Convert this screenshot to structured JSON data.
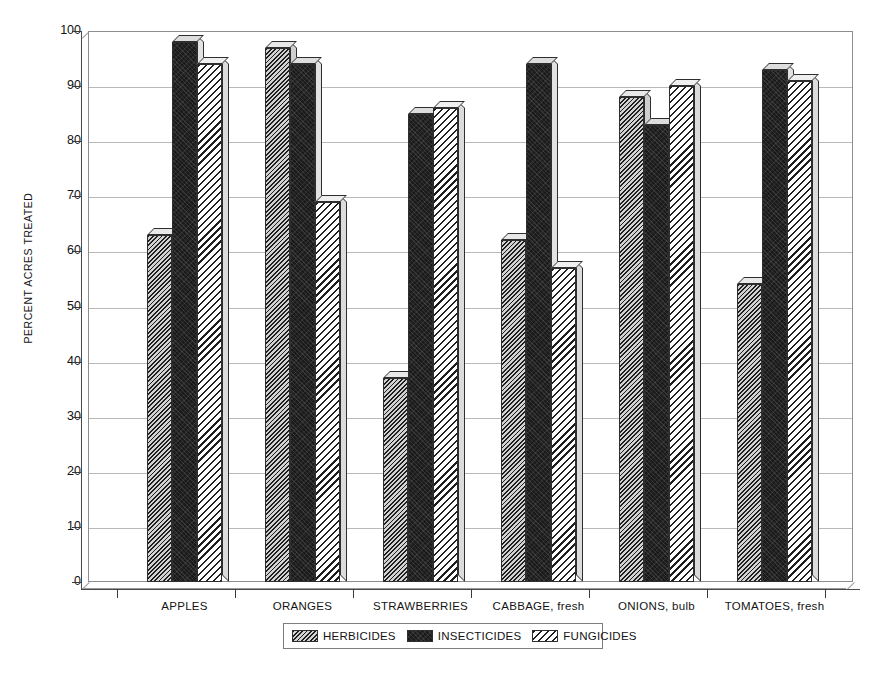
{
  "chart_data": {
    "type": "bar",
    "title": "",
    "subtitle": "",
    "xlabel": "",
    "ylabel": "PERCENT ACRES TREATED",
    "ylim": [
      0,
      100
    ],
    "yticks": [
      0,
      10,
      20,
      30,
      40,
      50,
      60,
      70,
      80,
      90,
      100
    ],
    "ytick_labels": [
      "0",
      "10",
      "20",
      "30",
      "40",
      "50",
      "60",
      "70",
      "80",
      "90",
      "100"
    ],
    "grid": true,
    "grid_axis": "y",
    "legend_position": "bottom-center",
    "categories": [
      "APPLES",
      "ORANGES",
      "STRAWBERRIES",
      "CABBAGE, fresh",
      "ONIONS, bulb",
      "TOMATOES, fresh"
    ],
    "series": [
      {
        "name": "HERBICIDES",
        "pattern": "dense-diagonal-hatch",
        "color": "#9a9a9a",
        "values": [
          63,
          97,
          37,
          62,
          88,
          54
        ]
      },
      {
        "name": "INSECTICIDES",
        "pattern": "solid-black",
        "color": "#1b1b1b",
        "values": [
          98,
          94,
          85,
          94,
          83,
          93
        ]
      },
      {
        "name": "FUNGICIDES",
        "pattern": "coarse-diagonal-hatch",
        "color": "#ffffff",
        "values": [
          94,
          69,
          86,
          57,
          90,
          91
        ]
      }
    ],
    "annotations": []
  },
  "legend": {
    "entries": [
      {
        "label": "HERBICIDES"
      },
      {
        "label": "INSECTICIDES"
      },
      {
        "label": "FUNGICIDES"
      }
    ]
  },
  "colors": {
    "axis": "#4a4a4a",
    "grid": "#b9b9b9",
    "frame": "#8d8d8d",
    "text": "#131313",
    "background": "#ffffff"
  }
}
